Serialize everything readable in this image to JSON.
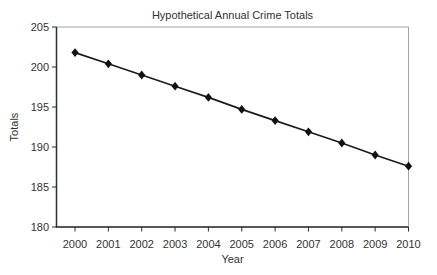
{
  "chart_data": {
    "type": "line",
    "title": "Hypothetical Annual Crime Totals",
    "xlabel": "Year",
    "ylabel": "Totals",
    "x": [
      2000,
      2001,
      2002,
      2003,
      2004,
      2005,
      2006,
      2007,
      2008,
      2009,
      2010
    ],
    "series": [
      {
        "name": "Annual crime total",
        "values": [
          201.8,
          200.4,
          199.0,
          197.6,
          196.2,
          194.7,
          193.3,
          191.9,
          190.5,
          189.0,
          187.6
        ]
      }
    ],
    "ylim": [
      180,
      205
    ],
    "yticks": [
      180,
      185,
      190,
      195,
      200,
      205
    ],
    "grid": false,
    "legend": false,
    "marker": "diamond",
    "colors": {
      "line": "#1c1c1c",
      "marker": "#111111",
      "axis": "#2e2e2e",
      "plot_border": "#a5a5a5",
      "text": "#323232",
      "background": "#ffffff"
    }
  }
}
